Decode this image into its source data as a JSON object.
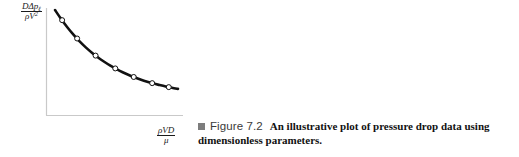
{
  "figure": {
    "caption": {
      "bullet_icon": "filled-square-icon",
      "bullet_color": "#7d7d7d",
      "figure_number": "Figure 7.2",
      "text": "An illustrative plot of pressure drop data using dimensionless parameters."
    },
    "axis_labels": {
      "y": {
        "numerator_main": "D",
        "numerator_delta": "Δp",
        "numerator_sub": "ℓ",
        "denominator_rho": "ρV",
        "denominator_sup": "2",
        "plain": "DΔpℓ / ρV²"
      },
      "x": {
        "numerator": "ρVD",
        "denominator": "μ",
        "plain": "ρVD / μ"
      }
    }
  },
  "chart_data": {
    "type": "line",
    "title": "",
    "subtitle": "",
    "xlabel": "ρVD / μ",
    "ylabel": "DΔpℓ / ρV²",
    "grid": false,
    "legend": null,
    "axis_color": "#c9c9c9",
    "curve_color": "#111111",
    "marker_style": "open-circle",
    "marker_fill": "#ffffff",
    "marker_edge": "#111111",
    "xlim": [
      0,
      1
    ],
    "ylim": [
      0,
      1
    ],
    "x_tick_labels": [],
    "y_tick_labels": [],
    "curve_points": [
      [
        0.0,
        1.0
      ],
      [
        0.05,
        0.905
      ],
      [
        0.1,
        0.818
      ],
      [
        0.15,
        0.74
      ],
      [
        0.2,
        0.67
      ],
      [
        0.25,
        0.607
      ],
      [
        0.3,
        0.551
      ],
      [
        0.35,
        0.5
      ],
      [
        0.4,
        0.455
      ],
      [
        0.45,
        0.414
      ],
      [
        0.5,
        0.378
      ],
      [
        0.55,
        0.345
      ],
      [
        0.6,
        0.316
      ],
      [
        0.65,
        0.29
      ],
      [
        0.7,
        0.266
      ],
      [
        0.75,
        0.245
      ],
      [
        0.8,
        0.226
      ],
      [
        0.85,
        0.21
      ],
      [
        0.9,
        0.195
      ],
      [
        0.95,
        0.182
      ],
      [
        1.0,
        0.17
      ]
    ],
    "series": [
      {
        "name": "pressure drop data",
        "marker_points": [
          [
            0.058,
            0.893
          ],
          [
            0.18,
            0.7
          ],
          [
            0.33,
            0.52
          ],
          [
            0.49,
            0.385
          ],
          [
            0.64,
            0.295
          ],
          [
            0.79,
            0.23
          ],
          [
            0.925,
            0.188
          ]
        ]
      }
    ]
  }
}
